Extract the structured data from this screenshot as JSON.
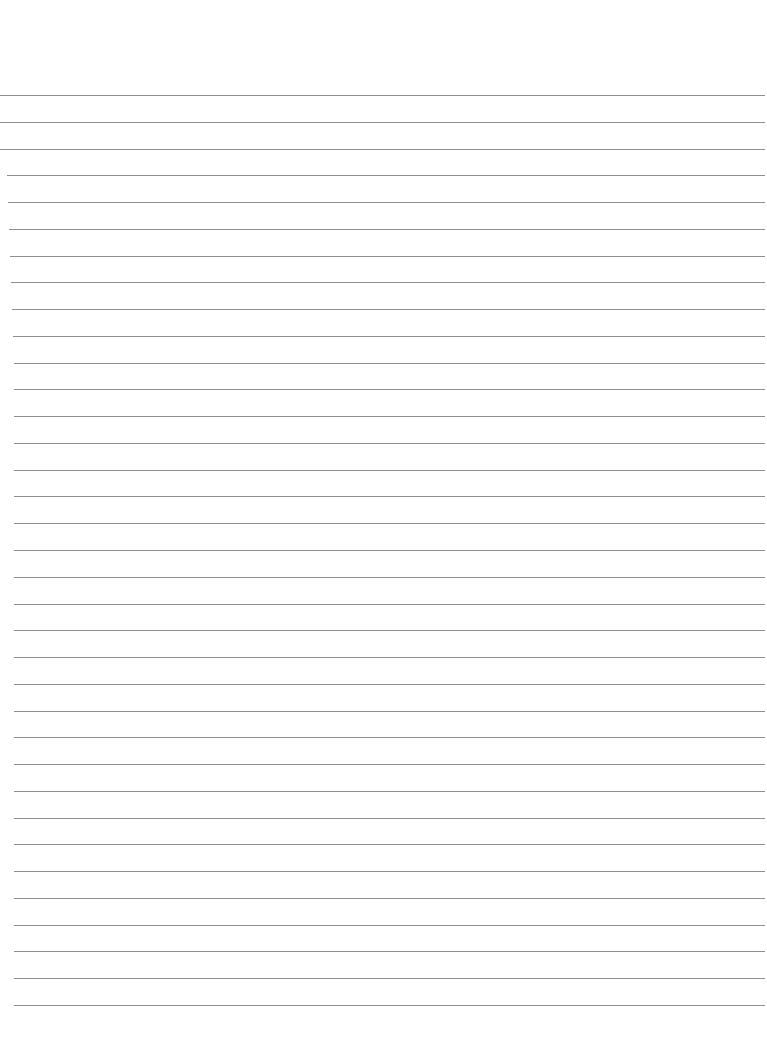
{
  "page": {
    "type": "ruled-paper",
    "background_color": "#ffffff",
    "line_color": "#8f8f8f",
    "line_count": 35,
    "first_line_y": 95,
    "last_line_y": 1005
  }
}
